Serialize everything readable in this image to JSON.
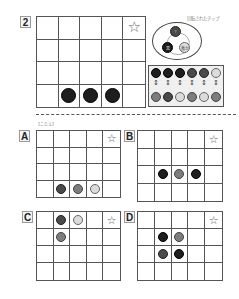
{
  "question": {
    "number": "2",
    "grid": {
      "cols": 5,
      "rows": 4,
      "star_cell": [
        0,
        4
      ]
    },
    "chips": [
      {
        "row": 3,
        "col": 1,
        "color": "black",
        "text": ""
      },
      {
        "row": 3,
        "col": 2,
        "color": "black",
        "text": ""
      },
      {
        "row": 3,
        "col": 3,
        "color": "black",
        "text": ""
      }
    ],
    "star_icon": "☆"
  },
  "rotation_legend": {
    "caption": "回転されたチップ",
    "chips": [
      {
        "color": "dark",
        "text": "?"
      },
      {
        "color": "black",
        "text": "黒"
      },
      {
        "color": "light",
        "text": "黄か"
      }
    ]
  },
  "chip_mapping": {
    "top_row": [
      "black",
      "black",
      "black",
      "dark",
      "dark",
      "light"
    ],
    "bottom_row": [
      "gray",
      "dark",
      "light",
      "gray",
      "light",
      "gray"
    ],
    "arrow_icon": "↕"
  },
  "answer_caption": "【こたえ】",
  "options": [
    {
      "label": "A",
      "chips": [
        {
          "row": 3,
          "col": 1,
          "color": "dark"
        },
        {
          "row": 3,
          "col": 2,
          "color": "gray"
        },
        {
          "row": 3,
          "col": 3,
          "color": "light"
        }
      ]
    },
    {
      "label": "B",
      "chips": [
        {
          "row": 2,
          "col": 1,
          "color": "black"
        },
        {
          "row": 2,
          "col": 2,
          "color": "gray"
        },
        {
          "row": 2,
          "col": 3,
          "color": "black"
        }
      ]
    },
    {
      "label": "C",
      "chips": [
        {
          "row": 0,
          "col": 1,
          "color": "dark"
        },
        {
          "row": 0,
          "col": 2,
          "color": "light"
        },
        {
          "row": 1,
          "col": 1,
          "color": "gray"
        }
      ]
    },
    {
      "label": "D",
      "chips": [
        {
          "row": 1,
          "col": 1,
          "color": "black"
        },
        {
          "row": 1,
          "col": 2,
          "color": "gray"
        },
        {
          "row": 2,
          "col": 1,
          "color": "dark"
        },
        {
          "row": 2,
          "col": 2,
          "color": "black"
        }
      ]
    }
  ]
}
